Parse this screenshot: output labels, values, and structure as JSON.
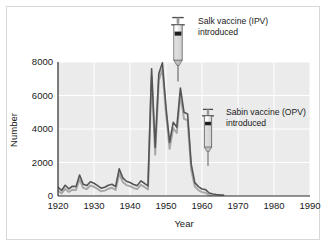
{
  "figure": {
    "border_color": "#d8d8d8",
    "background": "#ffffff"
  },
  "chart_data": {
    "type": "line",
    "title": "",
    "xlabel": "Year",
    "ylabel": "Number",
    "xlim": [
      1920,
      1990
    ],
    "ylim": [
      0,
      8000
    ],
    "xticks": [
      1920,
      1930,
      1940,
      1950,
      1960,
      1970,
      1980,
      1990
    ],
    "xtick_labels": [
      "1920",
      "1930",
      "1940",
      "1950",
      "1960",
      "1970",
      "1980",
      "1990"
    ],
    "yticks": [
      0,
      2000,
      4000,
      6000,
      8000
    ],
    "ytick_labels": [
      "0",
      "2000",
      "4000",
      "6000",
      "8000"
    ],
    "grid": true,
    "grid_color": "#ffffff",
    "plot_background": "#ebebeb",
    "legend": null,
    "legend_position": "none",
    "series": [
      {
        "name": "primary",
        "color": "#555555",
        "line_width": 1.6,
        "x": [
          1920,
          1921,
          1922,
          1923,
          1924,
          1925,
          1926,
          1927,
          1928,
          1929,
          1930,
          1931,
          1932,
          1933,
          1934,
          1935,
          1936,
          1937,
          1938,
          1939,
          1940,
          1941,
          1942,
          1943,
          1944,
          1945,
          1946,
          1947,
          1948,
          1949,
          1950,
          1951,
          1952,
          1953,
          1954,
          1955,
          1956,
          1957,
          1958,
          1959,
          1960,
          1961,
          1962,
          1963,
          1964,
          1965,
          1966
        ],
        "values": [
          520,
          330,
          640,
          430,
          580,
          560,
          1250,
          700,
          620,
          850,
          760,
          620,
          470,
          520,
          640,
          700,
          560,
          1620,
          1080,
          880,
          810,
          690,
          620,
          900,
          760,
          600,
          7600,
          2900,
          7300,
          7950,
          5300,
          3200,
          4400,
          4100,
          6450,
          5000,
          4900,
          1900,
          800,
          560,
          420,
          380,
          180,
          120,
          90,
          70,
          60
        ]
      },
      {
        "name": "secondary-shadow",
        "color": "#a8a8a8",
        "line_width": 2.0,
        "x": [
          1920,
          1921,
          1922,
          1923,
          1924,
          1925,
          1926,
          1927,
          1928,
          1929,
          1930,
          1931,
          1932,
          1933,
          1934,
          1935,
          1936,
          1937,
          1938,
          1939,
          1940,
          1941,
          1942,
          1943,
          1944,
          1945,
          1946,
          1947,
          1948,
          1949,
          1950,
          1951,
          1952,
          1953,
          1954,
          1955,
          1956,
          1957,
          1958,
          1959,
          1960,
          1961,
          1962,
          1963,
          1964,
          1965,
          1966
        ],
        "values": [
          400,
          250,
          520,
          330,
          470,
          450,
          1080,
          580,
          500,
          720,
          640,
          510,
          370,
          410,
          520,
          580,
          450,
          1420,
          930,
          740,
          680,
          570,
          500,
          760,
          630,
          480,
          7200,
          2550,
          7000,
          7650,
          5000,
          2900,
          4150,
          3850,
          6150,
          4700,
          4600,
          1650,
          650,
          440,
          320,
          290,
          130,
          90,
          70,
          55,
          45
        ]
      }
    ],
    "annotations": [
      {
        "id": "salk",
        "icon": "syringe-icon",
        "label_line1": "Salk vaccine (IPV)",
        "label_line2": "introduced",
        "year": 1955,
        "pointer_value": 8000
      },
      {
        "id": "sabin",
        "icon": "syringe-icon",
        "label_line1": "Sabin vaccine (OPV)",
        "label_line2": "introduced",
        "year": 1962,
        "pointer_value": 1000
      }
    ]
  }
}
